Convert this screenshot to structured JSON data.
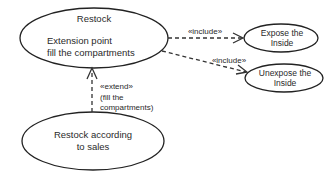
{
  "diagram": {
    "type": "UML use case diagram",
    "use_cases": [
      {
        "id": "restock",
        "title": "Restock",
        "extension_point_heading": "Extension point",
        "extension_point_name": "fill the compartments"
      },
      {
        "id": "expose",
        "line1": "Expose the",
        "line2": "Inside"
      },
      {
        "id": "unexpose",
        "line1": "Unexpose the",
        "line2": "Inside"
      },
      {
        "id": "restock-sales",
        "line1": "Restock according",
        "line2": "to sales"
      }
    ],
    "relationships": [
      {
        "from": "restock",
        "to": "expose",
        "stereotype": "«include»"
      },
      {
        "from": "restock",
        "to": "unexpose",
        "stereotype": "«include»"
      },
      {
        "from": "restock-sales",
        "to": "restock",
        "stereotype": "«extend»",
        "condition_line1": "(fill the",
        "condition_line2": "compartments)"
      }
    ],
    "colors": {
      "background": "#ffffff",
      "stroke": "#222222",
      "text": "#2a2a2a"
    }
  }
}
